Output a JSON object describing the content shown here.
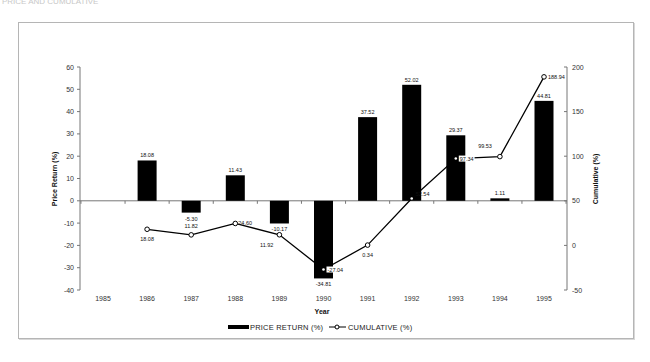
{
  "chart_data": {
    "type": "bar+line",
    "title": "",
    "xlabel": "Year",
    "ylabel_left": "Price Return (%)",
    "ylabel_right": "Cumulative (%)",
    "categories": [
      "1985",
      "1986",
      "1987",
      "1988",
      "1989",
      "1990",
      "1991",
      "1992",
      "1993",
      "1994",
      "1995"
    ],
    "ylim_left": [
      -40,
      60
    ],
    "yticks_left": [
      60,
      50,
      40,
      30,
      20,
      10,
      0,
      -10,
      -20,
      -30,
      -40
    ],
    "ylim_right": [
      -50,
      200
    ],
    "yticks_right": [
      200,
      150,
      100,
      50,
      0,
      -50
    ],
    "series": [
      {
        "name": "PRICE RETURN (%)",
        "type": "bar",
        "axis": "left",
        "color": "#000000",
        "values": [
          null,
          18.08,
          -5.3,
          11.43,
          -10.17,
          -34.81,
          37.52,
          52.02,
          29.37,
          1.11,
          44.81
        ],
        "labels": [
          "",
          "18.08",
          "-5.30",
          "11.43",
          "-10.17",
          "-34.81",
          "37.52",
          "52.02",
          "29.37",
          "1.11",
          "44.81"
        ]
      },
      {
        "name": "CUMULATIVE (%)",
        "type": "line",
        "axis": "right",
        "color": "#000000",
        "marker": "open-circle",
        "values": [
          null,
          18.08,
          11.82,
          24.6,
          11.92,
          -27.04,
          0.34,
          52.54,
          97.34,
          99.53,
          188.94
        ],
        "labels": [
          "",
          "18.08",
          "11.82",
          "24.60",
          "11.92",
          "-27.04",
          "0.34",
          "52.54",
          "97.34",
          "99.53",
          "188.94"
        ]
      }
    ],
    "legend": {
      "placement": "bottom-center",
      "entries": [
        "PRICE RETURN (%)",
        "CUMULATIVE (%)"
      ]
    },
    "grid": false
  },
  "page": {
    "faint_header": "PRICE AND CUMULATIVE"
  }
}
